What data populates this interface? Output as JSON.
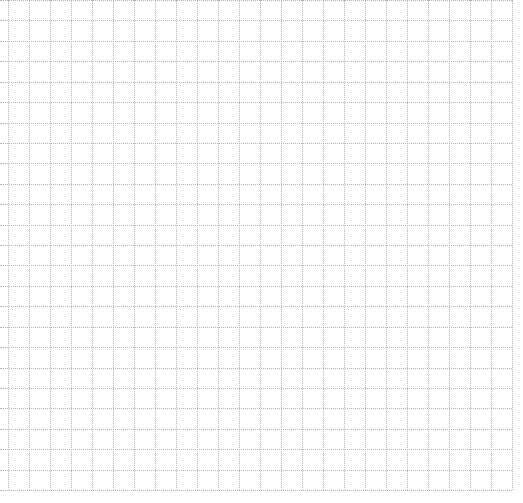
{
  "page": {
    "type": "graph-paper",
    "background": "#ffffff",
    "line_color": "#b5b5b5",
    "line_style": "dotted"
  },
  "grid": {
    "x_start": 8,
    "x_end": 512,
    "y_start": 0,
    "y_end": 490,
    "cell_size": 20.5,
    "columns": 24,
    "rows": 24
  }
}
